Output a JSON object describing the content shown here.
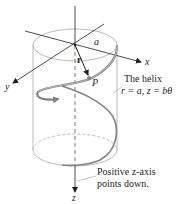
{
  "figure": {
    "axes": {
      "x_label": "x",
      "y_label": "y",
      "z_label": "z"
    },
    "radius_label": "a",
    "position_vector_label": "r",
    "point_label": "P",
    "helix_caption": {
      "title": "The helix",
      "equation": "r = a, z = bθ"
    },
    "z_axis_note": {
      "line1": "Positive z-axis",
      "line2": "points down."
    },
    "colors": {
      "ink": "#231f20",
      "cylinder": "#a7a9ac",
      "helix": "#808285",
      "helix_highlight": "#bcbec0"
    }
  }
}
